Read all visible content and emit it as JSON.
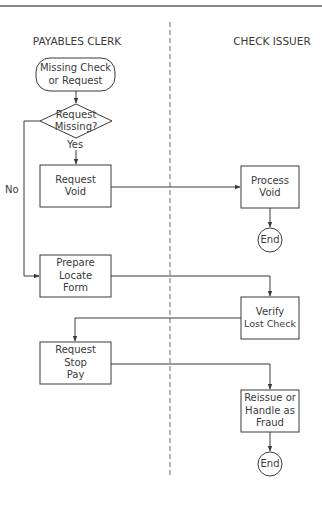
{
  "diagram": {
    "type": "swimlane-flowchart",
    "lanes": [
      {
        "id": "payables",
        "title": "PAYABLES CLERK"
      },
      {
        "id": "issuer",
        "title": "CHECK ISSUER"
      }
    ],
    "nodes": {
      "start": {
        "shape": "terminal",
        "lane": "payables",
        "line1": "Missing Check",
        "line2": "or Request"
      },
      "decision": {
        "shape": "diamond",
        "lane": "payables",
        "line1": "Request",
        "line2": "Missing?"
      },
      "request_void": {
        "shape": "process",
        "lane": "payables",
        "line1": "Request",
        "line2": "Void"
      },
      "prepare_form": {
        "shape": "process",
        "lane": "payables",
        "line1": "Prepare",
        "line2": "Locate",
        "line3": "Form"
      },
      "request_stop": {
        "shape": "process",
        "lane": "payables",
        "line1": "Request",
        "line2": "Stop",
        "line3": "Pay"
      },
      "process_void": {
        "shape": "process",
        "lane": "issuer",
        "line1": "Process",
        "line2": "Void"
      },
      "end1": {
        "shape": "end",
        "lane": "issuer",
        "label": "End"
      },
      "verify_lost": {
        "shape": "process",
        "lane": "issuer",
        "line1": "Verify",
        "line2": "Lost Check"
      },
      "reissue": {
        "shape": "process",
        "lane": "issuer",
        "line1": "Reissue or",
        "line2": "Handle as",
        "line3": "Fraud"
      },
      "end2": {
        "shape": "end",
        "lane": "issuer",
        "label": "End"
      }
    },
    "edges": [
      {
        "from": "start",
        "to": "decision",
        "label": ""
      },
      {
        "from": "decision",
        "to": "request_void",
        "label": "Yes"
      },
      {
        "from": "decision",
        "to": "prepare_form",
        "label": "No"
      },
      {
        "from": "request_void",
        "to": "process_void",
        "label": ""
      },
      {
        "from": "process_void",
        "to": "end1",
        "label": ""
      },
      {
        "from": "prepare_form",
        "to": "verify_lost",
        "label": ""
      },
      {
        "from": "verify_lost",
        "to": "request_stop",
        "label": ""
      },
      {
        "from": "request_stop",
        "to": "reissue",
        "label": ""
      },
      {
        "from": "reissue",
        "to": "end2",
        "label": ""
      }
    ],
    "edge_labels": {
      "yes": "Yes",
      "no": "No"
    },
    "colors": {
      "stroke": "#3a3a3a",
      "lane_divider": "#6a6a6a",
      "top_rule": "#8a8a8a",
      "background": "#ffffff"
    }
  }
}
